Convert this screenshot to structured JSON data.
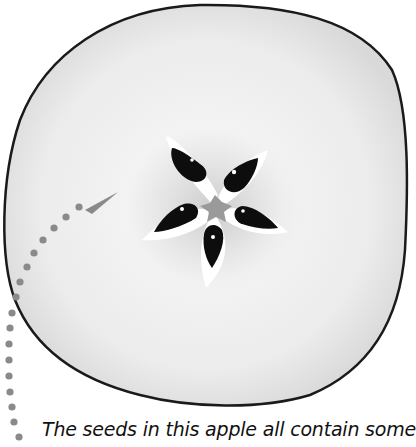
{
  "figure": {
    "seed_count": 5,
    "colors": {
      "flesh": "#efefef",
      "flesh_shadow": "#d6d6d6",
      "outline": "#1a1a1a",
      "seed": "#0d0d0d",
      "core": "#9a9a9a",
      "pointer": "#8a8a8a"
    }
  },
  "caption": {
    "text": "The seeds in this apple all contain some"
  }
}
